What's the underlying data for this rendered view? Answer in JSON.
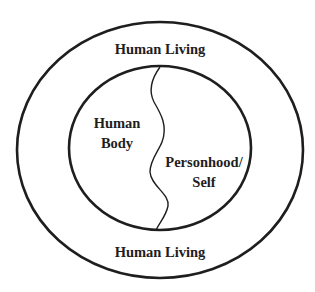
{
  "diagram": {
    "outer_ring": {
      "top_label": "Human Living",
      "bottom_label": "Human Living"
    },
    "inner_circle": {
      "left_region": {
        "line1": "Human",
        "line2": "Body"
      },
      "right_region": {
        "line1": "Personhood/",
        "line2": "Self"
      }
    },
    "colors": {
      "stroke": "#1e1e1e",
      "background": "#ffffff"
    }
  }
}
